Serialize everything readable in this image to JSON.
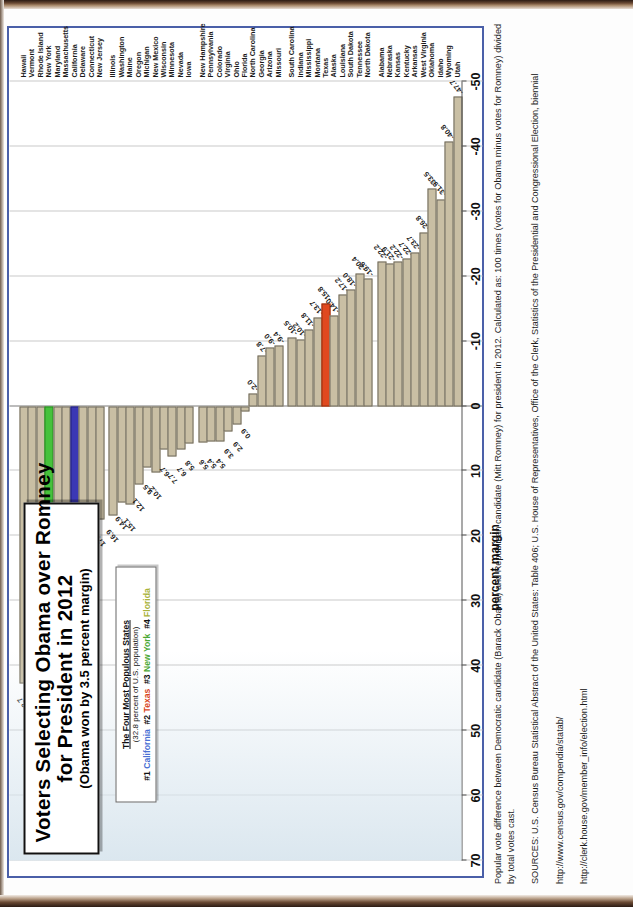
{
  "chart_data": {
    "type": "bar",
    "title_line1": "Voters Selecting Obama over Romney",
    "title_line2": "for President in 2012",
    "subtitle": "(Obama won by 3.5 percent margin)",
    "xlabel": "",
    "ylabel": "percent margin",
    "ylim": [
      -50,
      70
    ],
    "ticks": [
      "70",
      "60",
      "50",
      "40",
      "30",
      "20",
      "10",
      "0",
      "-10",
      "-20",
      "-30",
      "-40",
      "-50"
    ],
    "grid": true,
    "legend_position": "upper-left-inset",
    "orientation": "horizontal-bars-rotated-page",
    "highlight_colors": {
      "California": "#3b38b5",
      "New York": "#46c23b",
      "Texas": "#e0491f",
      "default": "#c9bfa4"
    },
    "categories": [
      "Hawaii",
      "Vermont",
      "Rhode Island",
      "New York",
      "Maryland",
      "Massachusetts",
      "California",
      "Delaware",
      "Connecticut",
      "New Jersey",
      "Illinois",
      "Washington",
      "Maine",
      "Oregon",
      "Michigan",
      "New Mexico",
      "Wisconsin",
      "Minnesota",
      "Nevada",
      "Iowa",
      "New Hampshire",
      "Pennsylvania",
      "Colorado",
      "Virginia",
      "Ohio",
      "Florida",
      "North Carolina",
      "Georgia",
      "Arizona",
      "Missouri",
      "South Carolina",
      "Indiana",
      "Mississippi",
      "Montana",
      "Texas",
      "Alaska",
      "Louisiana",
      "South Dakota",
      "Tennessee",
      "North Dakota",
      "Alabama",
      "Nebraska",
      "Kansas",
      "Kentucky",
      "Arkansas",
      "West Virginia",
      "Oklahoma",
      "Idaho",
      "Wyoming",
      "Utah"
    ],
    "values": [
      42.7,
      35.6,
      27.5,
      26.5,
      26.1,
      23.1,
      22.6,
      18.6,
      18.0,
      17.5,
      16.9,
      14.9,
      15.1,
      12.1,
      9.5,
      10.2,
      6.7,
      7.7,
      6.7,
      5.8,
      5.6,
      5.4,
      5.4,
      3.9,
      2.9,
      0.9,
      -2.0,
      -7.8,
      -9.0,
      -9.4,
      -10.5,
      -10.2,
      -11.8,
      -13.7,
      -15.8,
      -14.0,
      -17.2,
      -18.0,
      -20.4,
      -19.6,
      -22.2,
      -21.9,
      -22.2,
      -22.7,
      -23.7,
      -26.8,
      -33.5,
      -31.9,
      -40.8,
      -47.7
    ],
    "data_labels": [
      "42.7",
      "35.6",
      "27.5",
      "26.5",
      "26.1",
      "23.1",
      "22.6",
      "18.6",
      "18.0",
      "17.5",
      "16.9",
      "14.9",
      "15.1",
      "12.1",
      "9.5",
      "10.2",
      "6.7",
      "7.7",
      "6.7",
      "5.8",
      "5.6",
      "5.4",
      "5.4",
      "3.9",
      "2.9",
      "0.9",
      "-2.0",
      "-7.8",
      "-9.0",
      "-9.4",
      "-10.5",
      "-10.2",
      "-11.8",
      "-13.7",
      "-15.8",
      "-14.0",
      "-17.2",
      "-18.0",
      "-20.4",
      "-19.6",
      "-22.2",
      "-21.9",
      "-22.2",
      "-22.7",
      "-23.7",
      "-26.8",
      "-33.5",
      "-31.9",
      "-40.8",
      "-47.7"
    ]
  },
  "legend_box": {
    "heading": "The Four Most Populous States",
    "subheading": "(32.8 percent of U.S. population)",
    "entries": [
      {
        "rank": "#1",
        "state": "California",
        "color": "#4a6fd4"
      },
      {
        "rank": "#2",
        "state": "Texas",
        "color": "#d8461c"
      },
      {
        "rank": "#3",
        "state": "New York",
        "color": "#4aa832"
      },
      {
        "rank": "#4",
        "state": "Florida",
        "color": "#a9b33a"
      }
    ]
  },
  "notes": {
    "definition": "Popular vote difference between Democratic candidate (Barack Obama) and Republican candidate (Mitt Romney) for president in 2012. Calculated as: 100 times (votes for Obama minus votes for Romney) divided by total votes cast.",
    "sources": "SOURCES: U.S. Census Bureau Statistical Abstract of the United States: Table 406; U.S. House of Representatives, Office of the Clerk, Statistics of the Presidential and Congressional Election, biennial",
    "link1": "http://www.census.gov/compendia/statab/",
    "link2": "http://clerk.house.gov/member_info/election.html"
  }
}
